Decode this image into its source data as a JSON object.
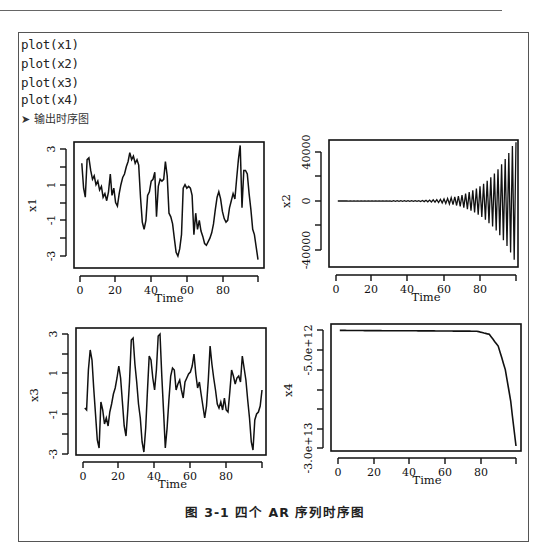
{
  "document": {
    "code_lines": [
      "plot(x1)",
      "plot(x2)",
      "plot(x3)",
      "plot(x4)"
    ],
    "output_note": "➤ 输出时序图",
    "caption": "图 3-1    四个 AR 序列时序图"
  },
  "chart_data": [
    {
      "type": "line",
      "title": "",
      "xlabel": "Time",
      "ylabel": "x1",
      "xticks": [
        "0",
        "20",
        "40",
        "60",
        "80"
      ],
      "yticks": [
        "-3",
        "-1",
        "1",
        "3"
      ],
      "xlim": [
        0,
        100
      ],
      "ylim": [
        -3.3,
        3.3
      ],
      "x": "1..100",
      "values": [
        2.2,
        0.8,
        0.3,
        2.4,
        2.5,
        1.8,
        1.3,
        1.5,
        1.0,
        1.2,
        0.7,
        0.9,
        0.3,
        0.5,
        0.1,
        0.6,
        1.6,
        0.4,
        0.8,
        0.0,
        -0.2,
        0.5,
        1.0,
        1.4,
        1.6,
        2.0,
        2.3,
        2.8,
        2.4,
        2.6,
        2.2,
        2.4,
        2.1,
        0.3,
        -1.1,
        -1.5,
        -1.0,
        0.4,
        0.6,
        1.2,
        1.3,
        1.7,
        -0.8,
        0.9,
        1.3,
        1.2,
        1.3,
        2.3,
        1.5,
        -0.6,
        -0.8,
        -1.2,
        -2.0,
        -2.8,
        -3.0,
        -2.6,
        -1.8,
        0.8,
        1.0,
        0.8,
        0.9,
        0.8,
        0.4,
        -1.8,
        -0.6,
        -1.5,
        -1.0,
        -1.6,
        -1.9,
        -2.3,
        -2.4,
        -2.2,
        -2.0,
        -1.7,
        -1.2,
        -0.4,
        0.3,
        0.6,
        0.2,
        -0.5,
        -0.9,
        -1.1,
        -1.0,
        -0.3,
        0.1,
        0.5,
        0.2,
        1.3,
        2.4,
        3.2,
        -0.3,
        1.8,
        1.8,
        1.6,
        0.5,
        -0.4,
        -1.5,
        -1.8,
        -2.5,
        -3.2
      ]
    },
    {
      "type": "line",
      "title": "",
      "xlabel": "Time",
      "ylabel": "x2",
      "xticks": [
        "0",
        "20",
        "40",
        "60",
        "80"
      ],
      "yticks": [
        "-40000",
        "0",
        "40000"
      ],
      "xlim": [
        0,
        100
      ],
      "ylim": [
        -52000,
        50000
      ],
      "x": "1..100",
      "description": "Flat near 0 until ~t=45, then oscillation with exponentially growing amplitude reaching about +48000 / -48000 at t=99-100",
      "envelope_points": [
        {
          "t": 0,
          "amp": 0
        },
        {
          "t": 45,
          "amp": 300
        },
        {
          "t": 55,
          "amp": 1000
        },
        {
          "t": 65,
          "amp": 3000
        },
        {
          "t": 75,
          "amp": 8000
        },
        {
          "t": 85,
          "amp": 18000
        },
        {
          "t": 92,
          "amp": 30000
        },
        {
          "t": 99,
          "amp": 48000
        }
      ]
    },
    {
      "type": "line",
      "title": "",
      "xlabel": "Time",
      "ylabel": "x3",
      "xticks": [
        "0",
        "20",
        "40",
        "60",
        "80"
      ],
      "yticks": [
        "-3",
        "-1",
        "1",
        "3"
      ],
      "xlim": [
        0,
        100
      ],
      "ylim": [
        -3.2,
        3.3
      ],
      "x": "1..100",
      "values": [
        -0.7,
        -0.8,
        1.2,
        2.2,
        1.7,
        0.3,
        -1.0,
        -2.3,
        -2.7,
        -0.4,
        -0.8,
        -1.5,
        -1.2,
        -1.6,
        -0.9,
        -0.5,
        0.0,
        0.3,
        0.8,
        1.4,
        0.8,
        -0.4,
        -1.6,
        -2.1,
        -0.8,
        0.6,
        2.7,
        2.8,
        1.5,
        0.6,
        -0.5,
        -1.2,
        -2.4,
        -2.9,
        -1.7,
        0.1,
        1.9,
        1.7,
        0.8,
        0.2,
        1.2,
        2.9,
        3.0,
        0.9,
        -0.9,
        -2.7,
        -1.7,
        -0.3,
        0.9,
        1.3,
        1.2,
        0.2,
        0.5,
        0.7,
        0.2,
        -0.2,
        0.6,
        0.8,
        1.0,
        1.1,
        1.4,
        2.0,
        1.0,
        0.3,
        0.6,
        0.0,
        -0.6,
        -1.2,
        -0.6,
        0.7,
        2.4,
        1.5,
        0.8,
        0.2,
        -0.5,
        -0.7,
        -0.4,
        -0.8,
        -0.2,
        -0.8,
        -0.9,
        0.1,
        1.2,
        0.9,
        0.5,
        0.8,
        0.9,
        0.6,
        1.9,
        1.3,
        0.7,
        -0.3,
        -1.2,
        -2.4,
        -2.8,
        -1.3,
        -1.0,
        -0.9,
        -0.6,
        0.2
      ]
    },
    {
      "type": "line",
      "title": "",
      "xlabel": "Time",
      "ylabel": "x4",
      "xticks": [
        "0",
        "20",
        "40",
        "60",
        "80"
      ],
      "yticks": [
        "-5.0e+12",
        "-3.0e+13"
      ],
      "xlim": [
        0,
        100
      ],
      "ylim": [
        -31000000000000.0,
        1500000000000.0
      ],
      "x": "1..100",
      "description": "Near 0 until ~t=78, then sharply decreasing (explosive) to about -2.95e+13 at t=100",
      "key_points": [
        {
          "t": 0,
          "v": 0
        },
        {
          "t": 78,
          "v": -200000000000.0
        },
        {
          "t": 85,
          "v": -1000000000000.0
        },
        {
          "t": 90,
          "v": -4000000000000.0
        },
        {
          "t": 94,
          "v": -10000000000000.0
        },
        {
          "t": 97,
          "v": -18000000000000.0
        },
        {
          "t": 100,
          "v": -29500000000000.0
        }
      ]
    }
  ]
}
